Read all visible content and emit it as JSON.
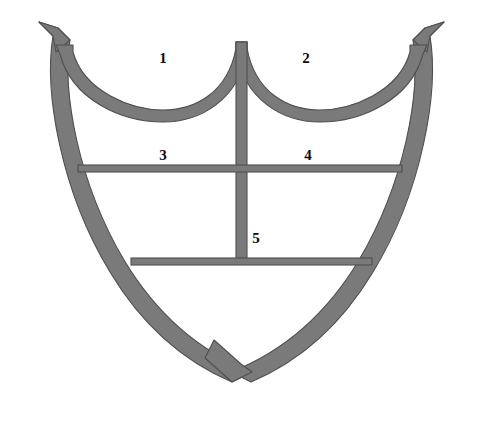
{
  "diagram": {
    "background_color": "#ffffff",
    "frame_fill_color": "#7a7a7a",
    "frame_stroke_color": "#4f4f4f",
    "label_color": "#0a0a0a",
    "width": 483,
    "height": 424
  },
  "labels": [
    {
      "id": "label-1",
      "text": "1",
      "x": 163,
      "y": 58,
      "describes": "upper-left-arch-lobe"
    },
    {
      "id": "label-2",
      "text": "2",
      "x": 306,
      "y": 58,
      "describes": "upper-right-arch-lobe"
    },
    {
      "id": "label-3",
      "text": "3",
      "x": 163,
      "y": 155,
      "describes": "left-middle-compartment"
    },
    {
      "id": "label-4",
      "text": "4",
      "x": 308,
      "y": 155,
      "describes": "right-middle-compartment"
    },
    {
      "id": "label-5",
      "text": "5",
      "x": 256,
      "y": 238,
      "describes": "lower-central-compartment"
    }
  ],
  "parts": {
    "outer_frame": "shield-outer-frame",
    "left_arch": "upper-left-arch",
    "right_arch": "upper-right-arch",
    "center_mullion": "center-vertical-mullion",
    "upper_transom": "upper-horizontal-transom",
    "lower_transom": "lower-horizontal-transom",
    "left_horn": "top-left-horn-finial",
    "right_horn": "top-right-horn-finial",
    "bottom_point": "bottom-crossing-point"
  }
}
